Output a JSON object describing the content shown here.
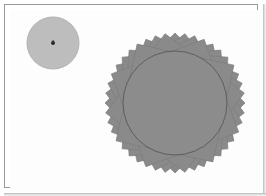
{
  "figure": {
    "background_color": "#ffffff",
    "frame": {
      "border_color": "#9a9a9a",
      "shadow_color": "#b9b9b9",
      "x": 4,
      "y": 4,
      "width": 254,
      "height": 184
    },
    "small_disc": {
      "name": "small-disc",
      "center_x": 53,
      "center_y": 43,
      "radius": 26,
      "fill_color": "#bdbdbd",
      "edge_color": "#b2b2b2",
      "center_marker": {
        "name": "center-point-marker",
        "x": 53,
        "y": 43,
        "radius": 2.0,
        "color": "#2a2a2a"
      }
    },
    "star_rosette": {
      "name": "star-rosette",
      "center_x": 175,
      "center_y": 103,
      "outer_radius": 70,
      "square_count": 11,
      "square_half_diagonal": 70,
      "fill_color": "#8a8a8a",
      "stroke_color": "#7c7c7c",
      "inscribed_disc": {
        "name": "inscribed-disc",
        "radius": 52,
        "fill_color": "#8c8c8c",
        "outline_color": "#5e5e5e",
        "outline_width": 1
      }
    }
  },
  "chart_data": {
    "type": "scatter",
    "xlabel": "",
    "ylabel": "",
    "xlim": [
      0,
      266
    ],
    "ylim": [
      0,
      196
    ],
    "grid": false,
    "legend": null,
    "annotations": [
      "small disc centered at (53, 43) with radius 26",
      "single dark point marker at disc center (53, 43)",
      "star rosette centered at (175, 103) formed by 11 rotated squares, outer radius 70",
      "inscribed circle of radius 52 filled gray with thin dark outline"
    ],
    "series": [
      {
        "name": "small-disc",
        "shape": "circle",
        "x": [
          53
        ],
        "y": [
          43
        ],
        "values": [
          26
        ]
      },
      {
        "name": "center-point",
        "shape": "point",
        "x": [
          53
        ],
        "y": [
          43
        ],
        "values": [
          2
        ]
      },
      {
        "name": "star-rosette",
        "shape": "rotated-squares",
        "x": [
          175
        ],
        "y": [
          103
        ],
        "values": [
          70
        ],
        "count": 11
      },
      {
        "name": "inscribed-disc",
        "shape": "circle",
        "x": [
          175
        ],
        "y": [
          103
        ],
        "values": [
          52
        ]
      }
    ]
  }
}
